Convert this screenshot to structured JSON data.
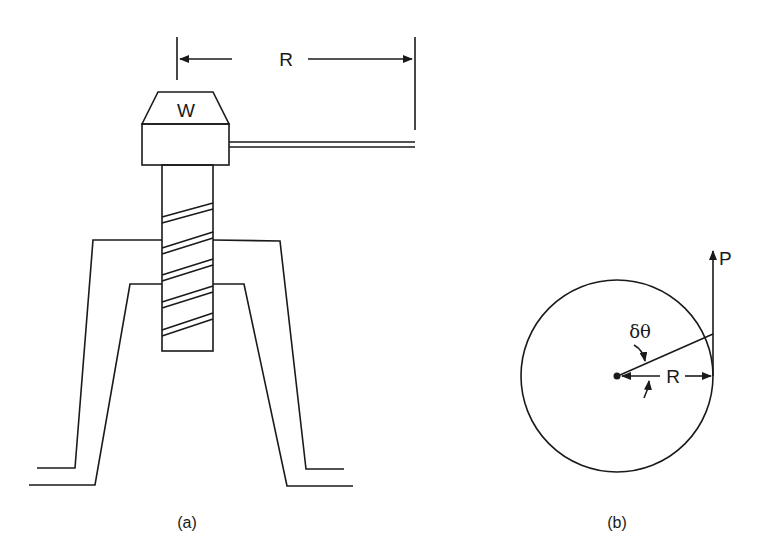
{
  "figure_a": {
    "caption": "(a)",
    "weight_label": "W",
    "radius_label": "R"
  },
  "figure_b": {
    "caption": "(b)",
    "force_label": "P",
    "angle_label": "δθ",
    "radius_label": "R"
  },
  "colors": {
    "ink": "#1a1a1a",
    "background": "#ffffff"
  }
}
